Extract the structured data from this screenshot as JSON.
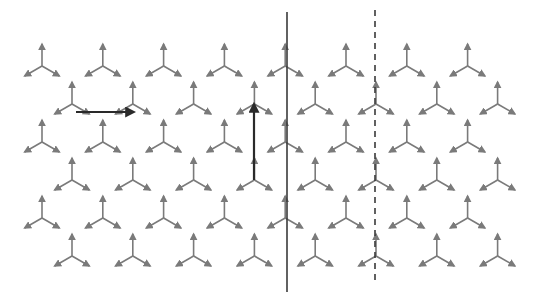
{
  "diagram": {
    "colors": {
      "tripod": "#7a7a7a",
      "arrow": "#2a2a2a",
      "solid_line": "#3a3a3a",
      "dashed_line": "#3a3a3a",
      "background": "#ffffff"
    },
    "lattice": {
      "rows": 6,
      "per_row": 8,
      "row_y": [
        66,
        104,
        142,
        180,
        218,
        256
      ],
      "odd_row_start_x": 42,
      "even_row_start_x": 72,
      "spacing_x": 60.8,
      "arm_up_length": 22,
      "arm_down_length": 20
    },
    "translation_vectors": [
      {
        "name": "horizontal-translation",
        "x1": 76,
        "y1": 112,
        "x2": 134,
        "y2": 112
      },
      {
        "name": "vertical-translation",
        "x1": 254,
        "y1": 180,
        "x2": 254,
        "y2": 104
      }
    ],
    "lines": [
      {
        "name": "mirror-line",
        "style": "solid",
        "x": 287,
        "y1": 12,
        "y2": 292
      },
      {
        "name": "glide-line",
        "style": "dashed",
        "x": 375,
        "y1": 10,
        "y2": 284
      }
    ]
  }
}
